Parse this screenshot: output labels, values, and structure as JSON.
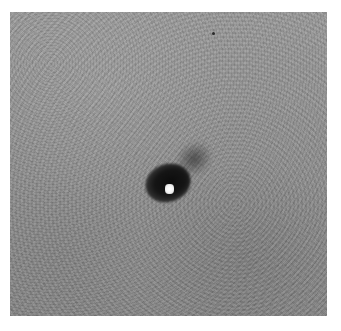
{
  "image": {
    "description": "Grayscale scientific image with a noisy gray background, a dark elongated blob near the center with a bright white point source at its core",
    "colors": {
      "background_frame": "#ffffff",
      "field_gray": "#8f8f8f",
      "blob_dark": "#111111",
      "core_bright": "#ffffff",
      "speck_dark": "#2a2a2a"
    },
    "features": [
      {
        "name": "dark-blob",
        "center_px": [
          158,
          176
        ]
      },
      {
        "name": "bright-core",
        "center_px": [
          170,
          180
        ]
      },
      {
        "name": "small-dark-speck",
        "center_px": [
          213,
          33
        ]
      }
    ]
  }
}
